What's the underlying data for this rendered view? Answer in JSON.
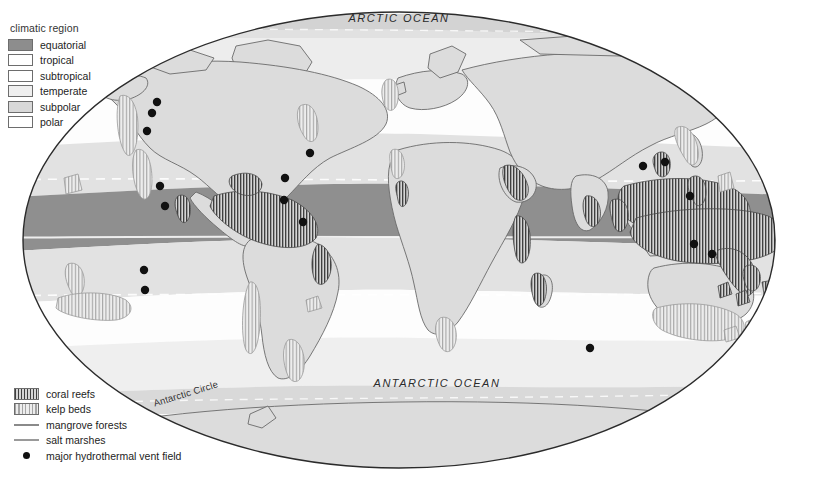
{
  "map": {
    "title": "World map of climatic regions and coastal marine ecosystems",
    "projection": "elliptical",
    "background_color": "#ffffff",
    "border_color": "#2b2b2b"
  },
  "climate_legend": {
    "title": "climatic region",
    "items": [
      {
        "label": "equatorial",
        "color": "#8d8d8d"
      },
      {
        "label": "tropical",
        "color": "#ffffff"
      },
      {
        "label": "subtropical",
        "color": "#ffffff"
      },
      {
        "label": "temperate",
        "color": "#efefef"
      },
      {
        "label": "subpolar",
        "color": "#d8d8d8"
      },
      {
        "label": "polar",
        "color": "#ffffff"
      }
    ]
  },
  "habitat_legend": {
    "items": [
      {
        "label": "coral reefs",
        "symbol": "hatch-dark",
        "color": "#4a4a4a"
      },
      {
        "label": "kelp beds",
        "symbol": "hatch-light",
        "color": "#9b9b9b"
      },
      {
        "label": "mangrove forests",
        "symbol": "line",
        "color": "#8a8a8a"
      },
      {
        "label": "salt marshes",
        "symbol": "line",
        "color": "#9a9a9a"
      },
      {
        "label": "major hydrothermal vent field",
        "symbol": "dot",
        "color": "#111111"
      }
    ]
  },
  "ocean_labels": [
    {
      "name": "arctic-ocean",
      "text": "ARCTIC OCEAN"
    },
    {
      "name": "antarctic-ocean",
      "text": "ANTARCTIC OCEAN"
    }
  ],
  "graticule_labels": [
    {
      "name": "antarctic-circle",
      "text": "Antarctic Circle"
    }
  ],
  "chart_data": {
    "type": "map",
    "projection": "elliptical (Mollweide-like)",
    "climate_bands": [
      {
        "region": "polar",
        "hemisphere": "north",
        "lat_range": [
          66,
          90
        ],
        "fill": "#ffffff"
      },
      {
        "region": "subpolar",
        "hemisphere": "north",
        "lat_range": [
          55,
          66
        ],
        "fill": "#d8d8d8"
      },
      {
        "region": "temperate",
        "hemisphere": "north",
        "lat_range": [
          40,
          55
        ],
        "fill": "#efefef"
      },
      {
        "region": "subtropical",
        "hemisphere": "north",
        "lat_range": [
          25,
          40
        ],
        "fill": "#ffffff"
      },
      {
        "region": "tropical",
        "hemisphere": "north",
        "lat_range": [
          10,
          25
        ],
        "fill": "#e3e3e3"
      },
      {
        "region": "equatorial",
        "hemisphere": "both",
        "lat_range": [
          -10,
          10
        ],
        "fill": "#8d8d8d"
      },
      {
        "region": "tropical",
        "hemisphere": "south",
        "lat_range": [
          -25,
          -10
        ],
        "fill": "#e3e3e3"
      },
      {
        "region": "subtropical",
        "hemisphere": "south",
        "lat_range": [
          -40,
          -25
        ],
        "fill": "#ffffff"
      },
      {
        "region": "temperate",
        "hemisphere": "south",
        "lat_range": [
          -55,
          -40
        ],
        "fill": "#efefef"
      },
      {
        "region": "subpolar",
        "hemisphere": "south",
        "lat_range": [
          -66,
          -55
        ],
        "fill": "#d8d8d8"
      },
      {
        "region": "polar",
        "hemisphere": "south",
        "lat_range": [
          -90,
          -66
        ],
        "fill": "#ffffff"
      }
    ],
    "graticule": {
      "equator": {
        "style": "solid-white"
      },
      "tropic_of_cancer": {
        "style": "dashed-white"
      },
      "tropic_of_capricorn": {
        "style": "dashed-white"
      },
      "arctic_circle": {
        "style": "dashed-white"
      },
      "antarctic_circle": {
        "style": "dashed-white",
        "labelled": true
      }
    },
    "hydrothermal_vent_fields": [
      {
        "region": "Juan de Fuca Ridge",
        "x": 157,
        "y": 102
      },
      {
        "region": "Gorda Ridge",
        "x": 152,
        "y": 113
      },
      {
        "region": "Explorer Ridge",
        "x": 147,
        "y": 131
      },
      {
        "region": "Guaymas Basin",
        "x": 160,
        "y": 186
      },
      {
        "region": "East Pacific Rise north",
        "x": 165,
        "y": 206
      },
      {
        "region": "Galapagos Rift",
        "x": 144,
        "y": 270
      },
      {
        "region": "East Pacific Rise south",
        "x": 145,
        "y": 290
      },
      {
        "region": "Mid-Atlantic Ridge 1",
        "x": 310,
        "y": 153
      },
      {
        "region": "Mid-Atlantic Ridge 2",
        "x": 285,
        "y": 178
      },
      {
        "region": "Mid-Atlantic Ridge 3",
        "x": 284,
        "y": 200
      },
      {
        "region": "Mid-Atlantic Ridge 4",
        "x": 303,
        "y": 222
      },
      {
        "region": "Okinawa Trough",
        "x": 643,
        "y": 166
      },
      {
        "region": "Izu-Bonin Arc",
        "x": 665,
        "y": 162
      },
      {
        "region": "Mariana Trough",
        "x": 690,
        "y": 196
      },
      {
        "region": "Manus Basin",
        "x": 694,
        "y": 244
      },
      {
        "region": "North Fiji Basin",
        "x": 712,
        "y": 254
      },
      {
        "region": "Southern Ocean vent",
        "x": 590,
        "y": 348
      }
    ],
    "vent_count": 17
  }
}
